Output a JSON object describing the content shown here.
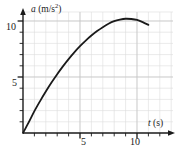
{
  "figure": {
    "name": "acceleration-time-graph",
    "width": 179,
    "height": 159,
    "background_color": "#ffffff"
  },
  "axes": {
    "y_axis_title": "a (m/s",
    "y_axis_title_exponent": "2",
    "y_axis_title_close": ")",
    "y_axis_symbol": "a",
    "y_axis_unit": "m/s²",
    "x_axis_title_symbol": "t",
    "x_axis_title_unit": "(s)",
    "x_axis_unit": "s",
    "axis_color": "#1a1a1a",
    "grid_color": "#d8d8d8",
    "has_arrowheads": true
  },
  "ticks": {
    "y_labels": [
      "5",
      "10"
    ],
    "x_labels": [
      "5",
      "10"
    ],
    "y_minor_step": 1,
    "x_minor_step": 1
  },
  "chart_data": {
    "type": "line",
    "title": "",
    "subtitle": "",
    "xlabel": "t (s)",
    "ylabel": "a (m/s²)",
    "xlim": [
      0,
      13
    ],
    "ylim": [
      0,
      11.7
    ],
    "xticks": [
      5,
      10
    ],
    "yticks": [
      5,
      10
    ],
    "xtick_labels": [
      "5",
      "10"
    ],
    "ytick_labels": [
      "5",
      "10"
    ],
    "minor_grid": true,
    "grid": true,
    "legend": false,
    "legend_position": "none",
    "series": [
      {
        "name": "acceleration",
        "color": "#1a1a1a",
        "line_width": 1.8,
        "x": [
          0,
          0.5,
          1,
          1.5,
          2,
          2.5,
          3,
          3.5,
          4,
          4.5,
          5,
          5.5,
          6,
          6.5,
          7,
          7.5,
          8,
          8.5,
          9,
          9.5,
          10,
          10.5,
          11
        ],
        "y": [
          0,
          0.95,
          1.95,
          2.85,
          3.7,
          4.5,
          5.25,
          5.95,
          6.6,
          7.2,
          7.75,
          8.25,
          8.7,
          9.1,
          9.45,
          9.75,
          9.98,
          10.12,
          10.2,
          10.18,
          10.1,
          9.9,
          9.65
        ]
      }
    ],
    "annotations": {
      "peak_t": 9,
      "peak_a": 10.2,
      "start_t": 0,
      "start_a": 0,
      "end_t": 11,
      "end_a": 9.65
    }
  }
}
